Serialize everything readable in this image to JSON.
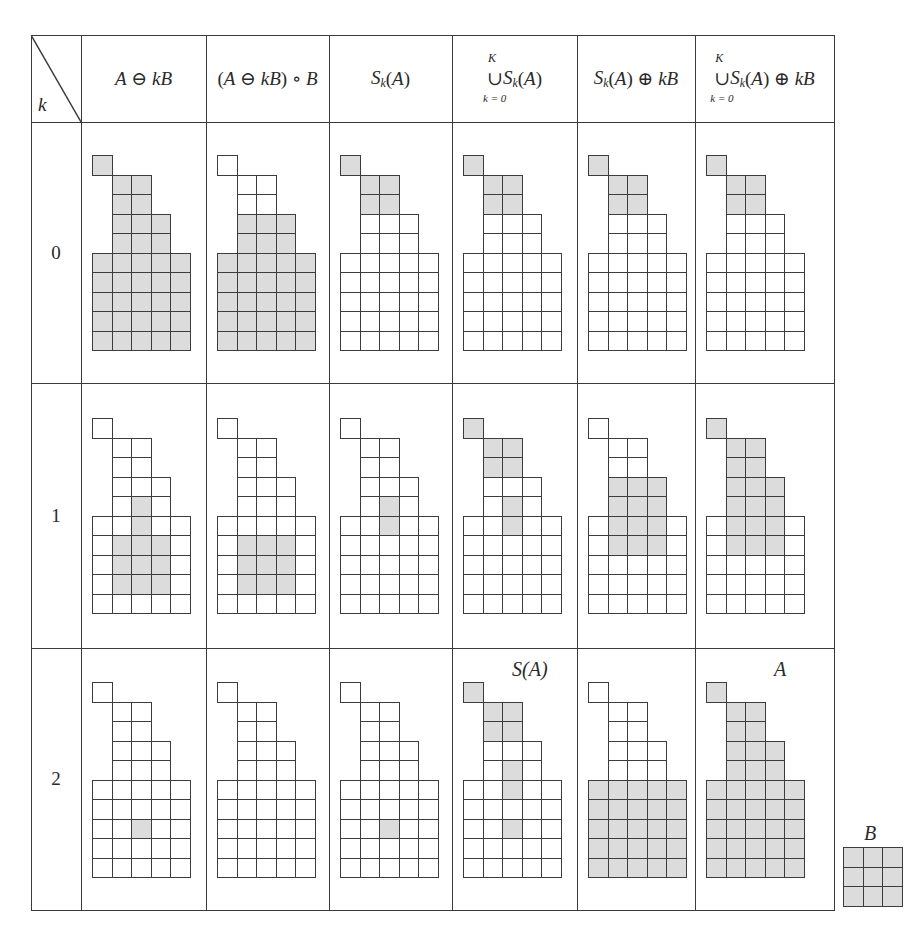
{
  "table": {
    "corner_label": "k",
    "headers": [
      {
        "id": "erosion",
        "text": "A ⊖ kB"
      },
      {
        "id": "opening",
        "text": "(A ⊖ kB) ∘ B"
      },
      {
        "id": "skeleton_subset",
        "text": "S_k(A)"
      },
      {
        "id": "skeleton_union",
        "text": "∪ S_k(A)",
        "upper": "K",
        "lower": "k = 0"
      },
      {
        "id": "subset_dilation",
        "text": "S_k(A) ⊕ kB"
      },
      {
        "id": "union_dilation",
        "text": "∪ S_k(A) ⊕ kB",
        "upper": "K",
        "lower": "k = 0"
      }
    ],
    "rows": [
      {
        "k": "0"
      },
      {
        "k": "1"
      },
      {
        "k": "2"
      }
    ]
  },
  "annotations": {
    "skeleton": "S(A)",
    "original": "A"
  },
  "structuring_element": {
    "label": "B",
    "size": [
      3,
      3
    ]
  },
  "colors": {
    "shaded": "#dcdcdc",
    "lines": "#3a3a3a"
  },
  "shape_A": {
    "description": "rows of the set A on a 10x5 grid, listed as [row, startCol, endCol]",
    "rows": [
      [
        0,
        0,
        0
      ],
      [
        1,
        1,
        2
      ],
      [
        2,
        1,
        2
      ],
      [
        3,
        1,
        3
      ],
      [
        4,
        1,
        3
      ],
      [
        5,
        0,
        4
      ],
      [
        6,
        0,
        4
      ],
      [
        7,
        0,
        4
      ],
      [
        8,
        0,
        4
      ],
      [
        9,
        0,
        4
      ]
    ]
  },
  "cells": [
    [
      {
        "shaded": [
          [
            0,
            0
          ],
          [
            1,
            1
          ],
          [
            1,
            2
          ],
          [
            2,
            1
          ],
          [
            2,
            2
          ],
          [
            3,
            1
          ],
          [
            3,
            2
          ],
          [
            3,
            3
          ],
          [
            4,
            1
          ],
          [
            4,
            2
          ],
          [
            4,
            3
          ],
          [
            5,
            0
          ],
          [
            5,
            1
          ],
          [
            5,
            2
          ],
          [
            5,
            3
          ],
          [
            5,
            4
          ],
          [
            6,
            0
          ],
          [
            6,
            1
          ],
          [
            6,
            2
          ],
          [
            6,
            3
          ],
          [
            6,
            4
          ],
          [
            7,
            0
          ],
          [
            7,
            1
          ],
          [
            7,
            2
          ],
          [
            7,
            3
          ],
          [
            7,
            4
          ],
          [
            8,
            0
          ],
          [
            8,
            1
          ],
          [
            8,
            2
          ],
          [
            8,
            3
          ],
          [
            8,
            4
          ],
          [
            9,
            0
          ],
          [
            9,
            1
          ],
          [
            9,
            2
          ],
          [
            9,
            3
          ],
          [
            9,
            4
          ]
        ]
      },
      {
        "shaded": [
          [
            3,
            1
          ],
          [
            3,
            2
          ],
          [
            3,
            3
          ],
          [
            4,
            1
          ],
          [
            4,
            2
          ],
          [
            4,
            3
          ],
          [
            5,
            0
          ],
          [
            5,
            1
          ],
          [
            5,
            2
          ],
          [
            5,
            3
          ],
          [
            5,
            4
          ],
          [
            6,
            0
          ],
          [
            6,
            1
          ],
          [
            6,
            2
          ],
          [
            6,
            3
          ],
          [
            6,
            4
          ],
          [
            7,
            0
          ],
          [
            7,
            1
          ],
          [
            7,
            2
          ],
          [
            7,
            3
          ],
          [
            7,
            4
          ],
          [
            8,
            0
          ],
          [
            8,
            1
          ],
          [
            8,
            2
          ],
          [
            8,
            3
          ],
          [
            8,
            4
          ],
          [
            9,
            0
          ],
          [
            9,
            1
          ],
          [
            9,
            2
          ],
          [
            9,
            3
          ],
          [
            9,
            4
          ]
        ]
      },
      {
        "shaded": [
          [
            0,
            0
          ],
          [
            1,
            1
          ],
          [
            1,
            2
          ],
          [
            2,
            1
          ],
          [
            2,
            2
          ]
        ]
      },
      {
        "shaded": [
          [
            0,
            0
          ],
          [
            1,
            1
          ],
          [
            1,
            2
          ],
          [
            2,
            1
          ],
          [
            2,
            2
          ]
        ]
      },
      {
        "shaded": [
          [
            0,
            0
          ],
          [
            1,
            1
          ],
          [
            1,
            2
          ],
          [
            2,
            1
          ],
          [
            2,
            2
          ]
        ]
      },
      {
        "shaded": [
          [
            0,
            0
          ],
          [
            1,
            1
          ],
          [
            1,
            2
          ],
          [
            2,
            1
          ],
          [
            2,
            2
          ]
        ]
      }
    ],
    [
      {
        "shaded": [
          [
            4,
            2
          ],
          [
            5,
            2
          ],
          [
            6,
            1
          ],
          [
            6,
            2
          ],
          [
            6,
            3
          ],
          [
            7,
            1
          ],
          [
            7,
            2
          ],
          [
            7,
            3
          ],
          [
            8,
            1
          ],
          [
            8,
            2
          ],
          [
            8,
            3
          ]
        ]
      },
      {
        "shaded": [
          [
            6,
            1
          ],
          [
            6,
            2
          ],
          [
            6,
            3
          ],
          [
            7,
            1
          ],
          [
            7,
            2
          ],
          [
            7,
            3
          ],
          [
            8,
            1
          ],
          [
            8,
            2
          ],
          [
            8,
            3
          ]
        ]
      },
      {
        "shaded": [
          [
            4,
            2
          ],
          [
            5,
            2
          ]
        ]
      },
      {
        "shaded": [
          [
            0,
            0
          ],
          [
            1,
            1
          ],
          [
            1,
            2
          ],
          [
            2,
            1
          ],
          [
            2,
            2
          ],
          [
            4,
            2
          ],
          [
            5,
            2
          ]
        ]
      },
      {
        "shaded": [
          [
            3,
            1
          ],
          [
            3,
            2
          ],
          [
            3,
            3
          ],
          [
            4,
            1
          ],
          [
            4,
            2
          ],
          [
            4,
            3
          ],
          [
            5,
            1
          ],
          [
            5,
            2
          ],
          [
            5,
            3
          ],
          [
            6,
            1
          ],
          [
            6,
            2
          ],
          [
            6,
            3
          ]
        ]
      },
      {
        "shaded": [
          [
            0,
            0
          ],
          [
            1,
            1
          ],
          [
            1,
            2
          ],
          [
            2,
            1
          ],
          [
            2,
            2
          ],
          [
            3,
            1
          ],
          [
            3,
            2
          ],
          [
            3,
            3
          ],
          [
            4,
            1
          ],
          [
            4,
            2
          ],
          [
            4,
            3
          ],
          [
            5,
            1
          ],
          [
            5,
            2
          ],
          [
            5,
            3
          ],
          [
            6,
            1
          ],
          [
            6,
            2
          ],
          [
            6,
            3
          ]
        ]
      }
    ],
    [
      {
        "shaded": [
          [
            7,
            2
          ]
        ]
      },
      {
        "shaded": []
      },
      {
        "shaded": [
          [
            7,
            2
          ]
        ]
      },
      {
        "shaded": [
          [
            0,
            0
          ],
          [
            1,
            1
          ],
          [
            1,
            2
          ],
          [
            2,
            1
          ],
          [
            2,
            2
          ],
          [
            4,
            2
          ],
          [
            5,
            2
          ],
          [
            7,
            2
          ]
        ]
      },
      {
        "shaded": [
          [
            5,
            0
          ],
          [
            5,
            1
          ],
          [
            5,
            2
          ],
          [
            5,
            3
          ],
          [
            5,
            4
          ],
          [
            6,
            0
          ],
          [
            6,
            1
          ],
          [
            6,
            2
          ],
          [
            6,
            3
          ],
          [
            6,
            4
          ],
          [
            7,
            0
          ],
          [
            7,
            1
          ],
          [
            7,
            2
          ],
          [
            7,
            3
          ],
          [
            7,
            4
          ],
          [
            8,
            0
          ],
          [
            8,
            1
          ],
          [
            8,
            2
          ],
          [
            8,
            3
          ],
          [
            8,
            4
          ],
          [
            9,
            0
          ],
          [
            9,
            1
          ],
          [
            9,
            2
          ],
          [
            9,
            3
          ],
          [
            9,
            4
          ]
        ]
      },
      {
        "shaded": [
          [
            0,
            0
          ],
          [
            1,
            1
          ],
          [
            1,
            2
          ],
          [
            2,
            1
          ],
          [
            2,
            2
          ],
          [
            3,
            1
          ],
          [
            3,
            2
          ],
          [
            3,
            3
          ],
          [
            4,
            1
          ],
          [
            4,
            2
          ],
          [
            4,
            3
          ],
          [
            5,
            0
          ],
          [
            5,
            1
          ],
          [
            5,
            2
          ],
          [
            5,
            3
          ],
          [
            5,
            4
          ],
          [
            6,
            0
          ],
          [
            6,
            1
          ],
          [
            6,
            2
          ],
          [
            6,
            3
          ],
          [
            6,
            4
          ],
          [
            7,
            0
          ],
          [
            7,
            1
          ],
          [
            7,
            2
          ],
          [
            7,
            3
          ],
          [
            7,
            4
          ],
          [
            8,
            0
          ],
          [
            8,
            1
          ],
          [
            8,
            2
          ],
          [
            8,
            3
          ],
          [
            8,
            4
          ],
          [
            9,
            0
          ],
          [
            9,
            1
          ],
          [
            9,
            2
          ],
          [
            9,
            3
          ],
          [
            9,
            4
          ]
        ]
      }
    ]
  ]
}
